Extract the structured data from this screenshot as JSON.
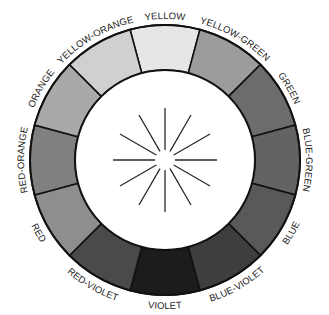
{
  "diagram": {
    "type": "color-wheel",
    "center": [
      165,
      160
    ],
    "outer_radius": 135,
    "inner_radius": 90,
    "label_radius": 141,
    "segments": [
      {
        "label": "YELLOW",
        "angle": 0,
        "shade": "#e6e6e6"
      },
      {
        "label": "YELLOW-GREEN",
        "angle": 30,
        "shade": "#9c9c9c"
      },
      {
        "label": "GREEN",
        "angle": 60,
        "shade": "#6c6c6c"
      },
      {
        "label": "BLUE-GREEN",
        "angle": 90,
        "shade": "#636363"
      },
      {
        "label": "BLUE",
        "angle": 120,
        "shade": "#595959"
      },
      {
        "label": "BLUE-VIOLET",
        "angle": 150,
        "shade": "#3e3e3e"
      },
      {
        "label": "VIOLET",
        "angle": 180,
        "shade": "#1c1c1c"
      },
      {
        "label": "RED-VIOLET",
        "angle": 210,
        "shade": "#4a4a4a"
      },
      {
        "label": "RED",
        "angle": 240,
        "shade": "#8e8e8e"
      },
      {
        "label": "RED-ORANGE",
        "angle": 270,
        "shade": "#808080"
      },
      {
        "label": "ORANGE",
        "angle": 300,
        "shade": "#a9a9a9"
      },
      {
        "label": "YELLOW-ORANGE",
        "angle": 330,
        "shade": "#d0d0d0"
      }
    ],
    "center_rays": {
      "count": 12,
      "inner_radius": 10,
      "outer_radius": 52,
      "color": "#2a2a2a"
    }
  }
}
